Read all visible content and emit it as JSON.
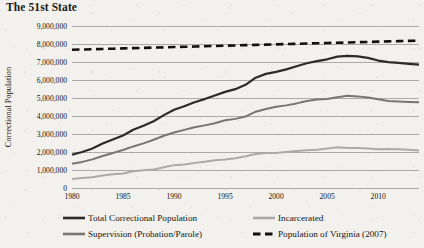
{
  "title": "The 51st State",
  "colors": {
    "background": "#f2f1ed",
    "total": "#2b2b2b",
    "supervision": "#767676",
    "incarcerated": "#aaaaaa",
    "virginia": "#111111",
    "grid": "#8d8d8d",
    "text": "#141414"
  },
  "axes": {
    "ylabel": "Correctional Population",
    "yticks": [
      "0",
      "1,000,000",
      "2,000,000",
      "3,000,000",
      "4,000,000",
      "5,000,000",
      "6,000,000",
      "7,000,000",
      "8,000,000",
      "9,000,000"
    ],
    "xticks": [
      "1980",
      "1985",
      "1990",
      "1995",
      "2000",
      "2005",
      "2010"
    ]
  },
  "legend": {
    "items": [
      {
        "label": "Total Correctional Population",
        "key": "total",
        "style": "solid"
      },
      {
        "label": "Incarcerated",
        "key": "incarcerated",
        "style": "solid"
      },
      {
        "label": "Supervision (Probation/Parole)",
        "key": "supervision",
        "style": "solid"
      },
      {
        "label": "Population of Virginia (2007)",
        "key": "virginia",
        "style": "dashed"
      }
    ]
  },
  "chart_data": {
    "type": "line",
    "title": "The 51st State",
    "xlabel": "",
    "ylabel": "Correctional Population",
    "xlim": [
      1980,
      2014
    ],
    "ylim": [
      0,
      9000000
    ],
    "grid": true,
    "legend_position": "bottom",
    "x": [
      1980,
      1981,
      1982,
      1983,
      1984,
      1985,
      1986,
      1987,
      1988,
      1989,
      1990,
      1991,
      1992,
      1993,
      1994,
      1995,
      1996,
      1997,
      1998,
      1999,
      2000,
      2001,
      2002,
      2003,
      2004,
      2005,
      2006,
      2007,
      2008,
      2009,
      2010,
      2011,
      2012,
      2013,
      2014
    ],
    "series": [
      {
        "name": "Total Correctional Population",
        "color": "#2b2b2b",
        "style": "solid",
        "values": [
          1850000,
          2000000,
          2190000,
          2470000,
          2700000,
          2920000,
          3240000,
          3460000,
          3710000,
          4050000,
          4350000,
          4540000,
          4760000,
          4940000,
          5140000,
          5340000,
          5490000,
          5730000,
          6130000,
          6340000,
          6450000,
          6590000,
          6760000,
          6930000,
          7050000,
          7150000,
          7300000,
          7340000,
          7310000,
          7230000,
          7080000,
          6990000,
          6950000,
          6900000,
          6850000
        ]
      },
      {
        "name": "Supervision (Probation/Parole)",
        "color": "#767676",
        "style": "solid",
        "values": [
          1350000,
          1450000,
          1590000,
          1780000,
          1940000,
          2110000,
          2310000,
          2480000,
          2680000,
          2900000,
          3080000,
          3230000,
          3370000,
          3480000,
          3600000,
          3760000,
          3840000,
          3970000,
          4240000,
          4390000,
          4510000,
          4590000,
          4700000,
          4830000,
          4920000,
          4950000,
          5040000,
          5120000,
          5090000,
          5030000,
          4930000,
          4830000,
          4800000,
          4780000,
          4760000
        ]
      },
      {
        "name": "Incarcerated",
        "color": "#aaaaaa",
        "style": "solid",
        "values": [
          500000,
          550000,
          600000,
          690000,
          760000,
          810000,
          930000,
          980000,
          1030000,
          1150000,
          1270000,
          1310000,
          1390000,
          1460000,
          1540000,
          1580000,
          1650000,
          1760000,
          1890000,
          1950000,
          1940000,
          2000000,
          2060000,
          2100000,
          2130000,
          2200000,
          2260000,
          2220000,
          2220000,
          2200000,
          2150000,
          2160000,
          2150000,
          2120000,
          2090000
        ]
      },
      {
        "name": "Population of Virginia (2007)",
        "color": "#111111",
        "style": "dashed",
        "values": [
          7680000,
          7695000,
          7710000,
          7725000,
          7740000,
          7755000,
          7770000,
          7785000,
          7800000,
          7815000,
          7830000,
          7845000,
          7860000,
          7875000,
          7890000,
          7905000,
          7920000,
          7935000,
          7950000,
          7965000,
          7980000,
          7995000,
          8010000,
          8025000,
          8040000,
          8055000,
          8070000,
          8085000,
          8100000,
          8115000,
          8130000,
          8145000,
          8160000,
          8175000,
          8190000
        ]
      }
    ]
  }
}
